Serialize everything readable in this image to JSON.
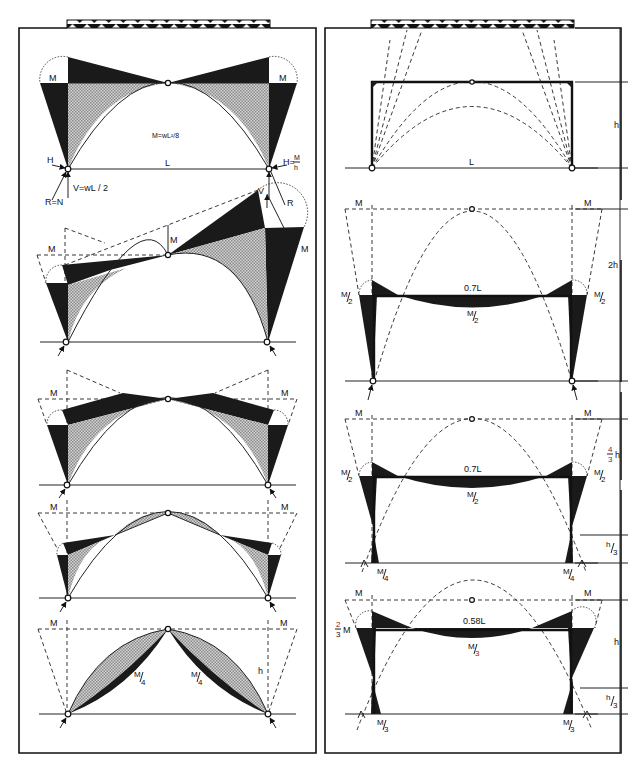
{
  "figure": {
    "left_panel": {
      "title": "Three-hinged arch / frame under uniform load — moment diagrams",
      "diagrams": [
        {
          "id": "d1",
          "labels": {
            "moment_left": "M",
            "moment_right": "M",
            "moment_formula": "M=wL²/8",
            "span": "L",
            "horizontal_left": "H",
            "horizontal_right": "H=",
            "horizontal_right_num": "M",
            "horizontal_right_den": "h",
            "vertical": "V=wL / 2",
            "reaction": "R=N"
          }
        },
        {
          "id": "d2",
          "labels": {
            "moment_left": "M",
            "moment_mid": "M",
            "moment_right": "M",
            "vertical": "V",
            "reaction": "R"
          }
        },
        {
          "id": "d3",
          "labels": {
            "moment_left": "M",
            "moment_right": "M"
          }
        },
        {
          "id": "d4",
          "labels": {
            "moment_left": "M",
            "moment_right": "M"
          }
        },
        {
          "id": "d5",
          "labels": {
            "moment_left": "M",
            "moment_right": "M",
            "quarter_left_num": "M",
            "quarter_left_den": "4",
            "quarter_right_num": "M",
            "quarter_right_den": "4",
            "height": "h"
          }
        }
      ]
    },
    "right_panel": {
      "title": "Portal frame thrust lines and moment diagrams",
      "diagrams": [
        {
          "id": "r1",
          "labels": {
            "span": "L",
            "height": "h"
          }
        },
        {
          "id": "r2",
          "labels": {
            "moment_left": "M",
            "moment_right": "M",
            "half_left_num": "M",
            "half_left_den": "2",
            "half_right_num": "M",
            "half_right_den": "2",
            "beam_length": "0.7L",
            "beam_moment_num": "M",
            "beam_moment_den": "2",
            "height": "2h"
          }
        },
        {
          "id": "r3",
          "labels": {
            "moment_left": "M",
            "moment_right": "M",
            "half_left_num": "M",
            "half_left_den": "2",
            "half_right_num": "M",
            "half_right_den": "2",
            "beam_length": "0.7L",
            "beam_moment_num": "M",
            "beam_moment_den": "2",
            "base_left_num": "M",
            "base_left_den": "4",
            "base_right_num": "M",
            "base_right_den": "4",
            "height_frac_num": "4",
            "height_frac_den": "3",
            "height_frac_var": "h",
            "low_height_num": "h",
            "low_height_den": "3"
          }
        },
        {
          "id": "r4",
          "labels": {
            "moment_left": "M",
            "moment_right": "M",
            "two_thirds_num": "2",
            "two_thirds_den": "3",
            "two_thirds_var": "M",
            "beam_length": "0.58L",
            "beam_moment_num": "M",
            "beam_moment_den": "3",
            "base_left_num": "M",
            "base_left_den": "3",
            "base_right_num": "M",
            "base_right_den": "3",
            "height": "h",
            "low_height_num": "h",
            "low_height_den": "3"
          }
        }
      ]
    },
    "colors": {
      "ink": "#111111",
      "dark_fill": "#1a1a1a",
      "hatch_fill": "#b8b8b8",
      "background": "#ffffff",
      "accent_red": "#8a1a2a"
    }
  }
}
